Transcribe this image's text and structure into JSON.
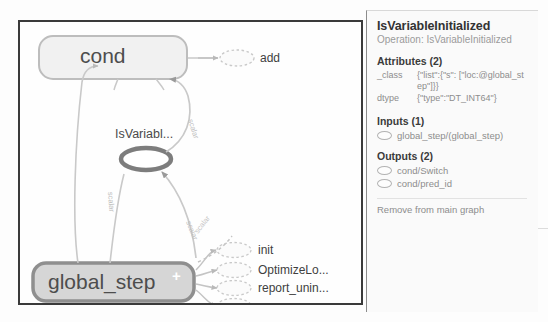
{
  "graph": {
    "nodes": [
      {
        "id": "cond",
        "label": "cond",
        "shape": "rounded-rect",
        "state": "normal"
      },
      {
        "id": "add",
        "label": "add",
        "shape": "dotted-ellipse",
        "state": "normal"
      },
      {
        "id": "isvariableinitialized",
        "label": "IsVariabl...",
        "shape": "ellipse",
        "state": "selected"
      },
      {
        "id": "global_step",
        "label": "global_step",
        "shape": "rounded-rect",
        "state": "expandable",
        "expand_glyph": "+"
      },
      {
        "id": "init",
        "label": "init",
        "shape": "dotted-ellipse",
        "state": "normal"
      },
      {
        "id": "optimizeloss",
        "label": "OptimizeLo...",
        "shape": "dotted-ellipse",
        "state": "normal"
      },
      {
        "id": "report_uninit",
        "label": "report_unin...",
        "shape": "dotted-ellipse",
        "state": "normal"
      },
      {
        "id": "save",
        "label": "save",
        "shape": "dotted-ellipse",
        "state": "normal"
      }
    ],
    "edge_labels": [
      {
        "id": "edge-label-1",
        "text": "scalar"
      },
      {
        "id": "edge-label-2",
        "text": "scalar"
      },
      {
        "id": "edge-label-3",
        "text": "scalar"
      },
      {
        "id": "edge-label-4",
        "text": "scalar"
      }
    ],
    "background_text": "One",
    "colors": {
      "canvas_border": "#3a3a3a",
      "node_fill": "#f1f1f1",
      "node_stroke": "#b8b8b8",
      "selected_stroke": "#6e6e6e",
      "edge_stroke": "#c4c4c4",
      "label_text": "#4a4a4a"
    }
  },
  "panel": {
    "title": "IsVariableInitialized",
    "subtitle": "Operation: IsVariableInitialized",
    "attributes": {
      "heading": "Attributes (2)",
      "rows": [
        {
          "key": "_class",
          "value": "{\"list\":{\"s\": [\"loc:@global_step\"]}}"
        },
        {
          "key": "dtype",
          "value": "{\"type\":\"DT_INT64\"}"
        }
      ]
    },
    "inputs": {
      "heading": "Inputs (1)",
      "items": [
        "global_step/(global_step)"
      ]
    },
    "outputs": {
      "heading": "Outputs (2)",
      "items": [
        "cond/Switch",
        "cond/pred_id"
      ]
    },
    "remove_button_label": "Remove from main graph"
  }
}
